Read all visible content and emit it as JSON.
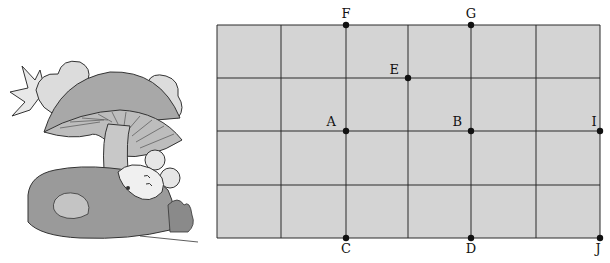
{
  "illustration": {
    "description": "Mouse sleeping on a rock under a mushroom",
    "elements": [
      "mushroom",
      "mouse",
      "rock",
      "bush",
      "clouds",
      "sun"
    ]
  },
  "grid": {
    "columns": 6,
    "rows": 4,
    "fill_color": "#d4d4d4",
    "line_color": "#2a2a2a",
    "x_lines": [
      217,
      281,
      346,
      408,
      471,
      536,
      600
    ],
    "y_lines": [
      25,
      78,
      131,
      185,
      238
    ]
  },
  "points": [
    {
      "name": "A",
      "label": "A",
      "x": 346,
      "y": 131,
      "lx": 336,
      "ly": 126,
      "anchor": "end"
    },
    {
      "name": "B",
      "label": "B",
      "x": 471,
      "y": 131,
      "lx": 462,
      "ly": 126,
      "anchor": "end"
    },
    {
      "name": "C",
      "label": "C",
      "x": 346,
      "y": 238,
      "lx": 346,
      "ly": 253,
      "anchor": "middle"
    },
    {
      "name": "D",
      "label": "D",
      "x": 471,
      "y": 238,
      "lx": 471,
      "ly": 253,
      "anchor": "middle"
    },
    {
      "name": "E",
      "label": "E",
      "x": 408,
      "y": 78,
      "lx": 399,
      "ly": 74,
      "anchor": "end"
    },
    {
      "name": "F",
      "label": "F",
      "x": 346,
      "y": 25,
      "lx": 346,
      "ly": 18,
      "anchor": "middle"
    },
    {
      "name": "G",
      "label": "G",
      "x": 471,
      "y": 25,
      "lx": 471,
      "ly": 18,
      "anchor": "middle"
    },
    {
      "name": "I",
      "label": "I",
      "x": 600,
      "y": 131,
      "lx": 594,
      "ly": 126,
      "anchor": "middle"
    },
    {
      "name": "J",
      "label": "J",
      "x": 600,
      "y": 238,
      "lx": 598,
      "ly": 253,
      "anchor": "middle"
    }
  ],
  "vertical_segments": [
    {
      "from": "F",
      "to": "C"
    },
    {
      "from": "G",
      "to": "D"
    }
  ]
}
